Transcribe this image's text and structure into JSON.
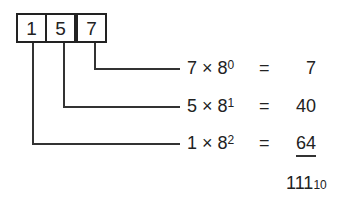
{
  "digits": [
    {
      "value": "1",
      "position": 2
    },
    {
      "value": "5",
      "position": 1
    },
    {
      "value": "7",
      "position": 0
    }
  ],
  "rows": [
    {
      "digit": "7",
      "times": "×",
      "base": "8",
      "exponent": "0",
      "equals": "=",
      "result": "7"
    },
    {
      "digit": "5",
      "times": "×",
      "base": "8",
      "exponent": "1",
      "equals": "=",
      "result": "40"
    },
    {
      "digit": "1",
      "times": "×",
      "base": "8",
      "exponent": "2",
      "equals": "=",
      "result": "64"
    }
  ],
  "total": {
    "value": "111",
    "base": "10"
  }
}
